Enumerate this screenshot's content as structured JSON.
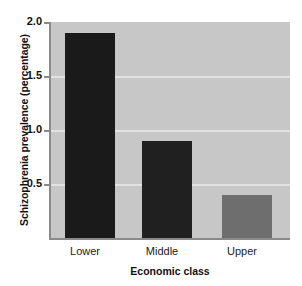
{
  "chart_data": {
    "type": "bar",
    "title": "",
    "categories": [
      "Lower",
      "Middle",
      "Upper"
    ],
    "values": [
      1.9,
      0.9,
      0.4
    ],
    "series": [
      {
        "name": "Schizophrenia prevalence",
        "values": [
          1.9,
          0.9,
          0.4
        ]
      }
    ],
    "xlabel": "Economic class",
    "ylabel": "Schizophrenia prevalence (percentage)",
    "ylim": [
      0,
      2.0
    ],
    "yticks": [
      "0.5",
      "1.0",
      "1.5",
      "2.0"
    ],
    "ytick_values": [
      0.5,
      1.0,
      1.5,
      2.0
    ],
    "grid": true,
    "legend": "none",
    "colors": {
      "plot_background": "#c7c7c7",
      "figure_background": "#ffffff",
      "gridline": "#e2e2e2",
      "axis": "#8a8a8a",
      "bar_lower": "#1a1a1a",
      "bar_middle": "#202020",
      "bar_upper": "#6e6e6e",
      "text": "#111111"
    },
    "bar_colors": [
      "#1a1a1a",
      "#202020",
      "#6e6e6e"
    ]
  }
}
